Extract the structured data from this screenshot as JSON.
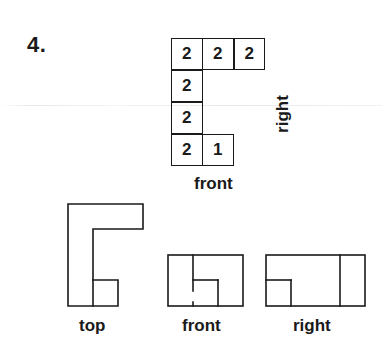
{
  "problem": {
    "number": "4."
  },
  "grid": {
    "description": "Top-down height map of a cube structure; numbers indicate stacked cube heights",
    "cells": [
      {
        "row": 0,
        "col": 0,
        "value": "2"
      },
      {
        "row": 0,
        "col": 1,
        "value": "2"
      },
      {
        "row": 0,
        "col": 2,
        "value": "2"
      },
      {
        "row": 1,
        "col": 0,
        "value": "2"
      },
      {
        "row": 2,
        "col": 0,
        "value": "2"
      },
      {
        "row": 3,
        "col": 0,
        "value": "2"
      },
      {
        "row": 3,
        "col": 1,
        "value": "1"
      }
    ],
    "front_label": "front",
    "right_label": "right"
  },
  "views": {
    "top_label": "top",
    "front_label": "front",
    "right_label": "right"
  },
  "colors": {
    "ink": "#1a1a1a",
    "background": "#ffffff"
  }
}
